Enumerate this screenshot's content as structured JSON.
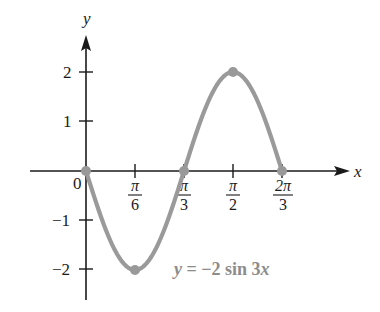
{
  "chart_data": {
    "type": "line",
    "title": "",
    "equation_label": "y = −2 sin 3x",
    "xlabel": "x",
    "ylabel": "y",
    "x_ticks": [
      {
        "value": 0,
        "label": "0"
      },
      {
        "value": 0.5236,
        "label": "π/6",
        "num": "π",
        "den": "6"
      },
      {
        "value": 1.0472,
        "label": "π/3",
        "num": "π",
        "den": "3"
      },
      {
        "value": 1.5708,
        "label": "π/2",
        "num": "π",
        "den": "2"
      },
      {
        "value": 2.0944,
        "label": "2π/3",
        "num": "2π",
        "den": "3"
      }
    ],
    "y_ticks": [
      {
        "value": 2,
        "label": "2"
      },
      {
        "value": 1,
        "label": "1"
      },
      {
        "value": -1,
        "label": "−1"
      },
      {
        "value": -2,
        "label": "−2"
      }
    ],
    "xlim": [
      -1.15,
      2.65
    ],
    "ylim": [
      -2.6,
      2.75
    ],
    "grid": false,
    "series": [
      {
        "name": "y = -2 sin 3x",
        "function": "-2*sin(3*x)",
        "domain": [
          0,
          2.0944
        ],
        "color": "#9a9a9a"
      }
    ],
    "highlighted_points": [
      {
        "x": 0,
        "y": 0
      },
      {
        "x": 0.5236,
        "y": -2
      },
      {
        "x": 1.0472,
        "y": 0
      },
      {
        "x": 1.5708,
        "y": 2
      },
      {
        "x": 2.0944,
        "y": 0
      }
    ]
  },
  "labels": {
    "x_axis": "x",
    "y_axis": "y",
    "origin": "0",
    "eq_y": "y",
    "eq_mid": " = −2 sin 3",
    "eq_x": "x",
    "xt1_num": "π",
    "xt1_den": "6",
    "xt2_num": "π",
    "xt2_den": "3",
    "xt3_num": "π",
    "xt3_den": "2",
    "xt4_num": "2π",
    "xt4_den": "3",
    "yt_2": "2",
    "yt_1": "1",
    "yt_m1": "−1",
    "yt_m2": "−2"
  }
}
